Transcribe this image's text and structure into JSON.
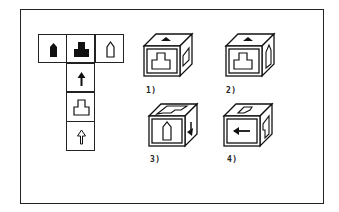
{
  "puzzle": {
    "type": "cube-net-folding",
    "net": {
      "top_row": [
        {
          "position": "left",
          "symbol": "filled-pointed-pillar"
        },
        {
          "position": "center",
          "symbol": "filled-stepped-block"
        },
        {
          "position": "right",
          "symbol": "outline-pointed-pillar"
        }
      ],
      "column": [
        {
          "position": "row-2",
          "symbol": "filled-up-arrow"
        },
        {
          "position": "row-3",
          "symbol": "outline-stepped-block"
        },
        {
          "position": "row-4",
          "symbol": "outline-up-arrow"
        }
      ]
    },
    "options": [
      {
        "label": "1)",
        "front": "outline-stepped-block",
        "top": "filled-up-arrow",
        "right": "outline-pointed-pillar"
      },
      {
        "label": "2)",
        "front": "outline-stepped-block",
        "top": "filled-up-arrow",
        "right": "outline-pointed-pillar"
      },
      {
        "label": "3)",
        "front": "outline-pointed-pillar",
        "top": "outline-stepped-block",
        "right": "filled-up-arrow"
      },
      {
        "label": "4)",
        "front": "filled-left-arrow",
        "top": "outline-pointed-pillar",
        "right": "outline-stepped-block"
      }
    ]
  },
  "colors": {
    "ink": "#222222",
    "background": "#ffffff"
  }
}
